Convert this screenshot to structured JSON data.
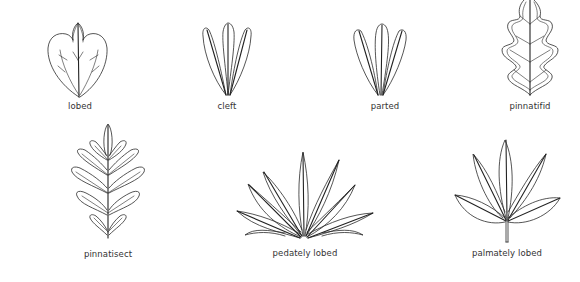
{
  "diagram": {
    "leaves": [
      {
        "id": "lobed",
        "label": "lobed",
        "icon": "lobed-leaf-icon"
      },
      {
        "id": "cleft",
        "label": "cleft",
        "icon": "cleft-leaf-icon"
      },
      {
        "id": "parted",
        "label": "parted",
        "icon": "parted-leaf-icon"
      },
      {
        "id": "pinnatifid",
        "label": "pinnatifid",
        "icon": "pinnatifid-leaf-icon"
      },
      {
        "id": "pinnatisect",
        "label": "pinnatisect",
        "icon": "pinnatisect-leaf-icon"
      },
      {
        "id": "pedately-lobed",
        "label": "pedately lobed",
        "icon": "pedately-lobed-leaf-icon"
      },
      {
        "id": "palmately-lobed",
        "label": "palmately lobed",
        "icon": "palmately-lobed-leaf-icon"
      }
    ],
    "colors": {
      "stroke": "#2a2a2a",
      "text": "#333333",
      "background": "#ffffff"
    }
  }
}
